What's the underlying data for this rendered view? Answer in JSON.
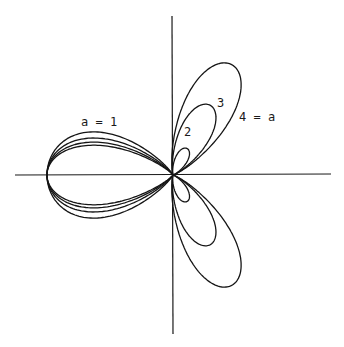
{
  "chart_data": {
    "type": "line",
    "title": "",
    "xlabel": "",
    "ylabel": "",
    "grid": false,
    "legend": "inline curve labels",
    "axes": {
      "origin_px": [
        173,
        175
      ],
      "x_axis_px": [
        15,
        331
      ],
      "y_axis_px": [
        16,
        334
      ]
    },
    "series": [
      {
        "name": "a = 1",
        "label": "a = 1",
        "left_lobe_length": 126,
        "left_lobe_halfwidth": 42,
        "right_lobe_length": 0,
        "right_lobe_halfwidth": 0
      },
      {
        "name": "a = 2",
        "label": "2",
        "left_lobe_length": 126,
        "left_lobe_halfwidth": 36,
        "right_lobe_length": 30,
        "right_lobe_halfwidth": 6
      },
      {
        "name": "a = 3",
        "label": "3",
        "left_lobe_length": 126,
        "left_lobe_halfwidth": 32,
        "right_lobe_length": 79,
        "right_lobe_halfwidth": 15
      },
      {
        "name": "a = 4",
        "label": "4 = a",
        "left_lobe_length": 126,
        "left_lobe_halfwidth": 29,
        "right_lobe_length": 125,
        "right_lobe_halfwidth": 24
      }
    ],
    "right_lobe_angle_deg": 62
  },
  "labels": {
    "a1": "a = 1",
    "a2": "2",
    "a3": "3",
    "a4": "4 = a"
  }
}
